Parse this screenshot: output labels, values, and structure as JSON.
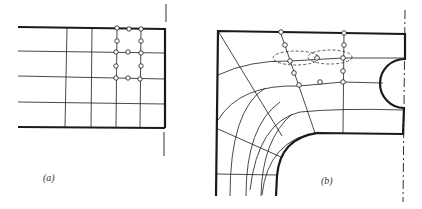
{
  "figure": {
    "panels": [
      {
        "id": "a",
        "caption": "(a)",
        "description": "Rectangular mesh corner with refined nodes"
      },
      {
        "id": "b",
        "caption": "(b)",
        "description": "Curved mesh around fillet with semicircular notch, dashed node-influence loops"
      }
    ]
  },
  "colors": {
    "line": "#1a1a1a",
    "background": "#ffffff"
  }
}
